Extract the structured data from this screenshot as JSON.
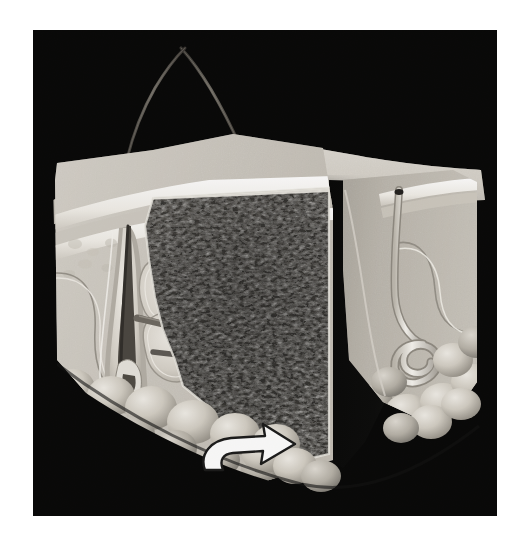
{
  "figure": {
    "domain": "anatomical-illustration",
    "subject": "Cross-section of human skin (three-dimensional block diagram)",
    "rendering": "grayscale airbrush / halftone medical illustration",
    "background_color": "#000000",
    "page_color": "#ffffff",
    "frame": {
      "x": 33,
      "y": 30,
      "width": 464,
      "height": 486
    },
    "palette": {
      "background_black": "#000000",
      "void_shadow": "#050505",
      "tissue_light": "#e3e0d9",
      "tissue_highlight": "#f4f2ec",
      "tissue_midtone": "#b9b4aa",
      "tissue_shadow": "#7d786f",
      "dermis_dark": "#2a2824",
      "dermis_fiber": "#6e6a61",
      "hair_shaft": "#4a4640",
      "arrow_fill": "#ffffff",
      "arrow_outline": "#1a1a1a",
      "fat_lobule": "#cfcac0",
      "fat_lobule_shadow": "#8d887e",
      "epidermis_band": "#f6f4ef",
      "gland_duct": "#f2efe8"
    },
    "structures": [
      {
        "id": "hair-shaft-left",
        "label": "Hair shaft (emergent, left)",
        "type": "hair-shaft",
        "description": "Long thin dark shaft curving up and to the right from the skin surface"
      },
      {
        "id": "hair-shaft-right",
        "label": "Hair shaft (emergent, right)",
        "type": "hair-shaft",
        "description": "Second shaft emerging from a follicular pore on the surface crest"
      },
      {
        "id": "skin-surface",
        "label": "Skin surface (epidermal surface)",
        "type": "surface",
        "description": "Pale undulating top plane of the tissue block"
      },
      {
        "id": "epidermis",
        "label": "Epidermis",
        "type": "layer",
        "description": "Bright narrow band along the upper cut face"
      },
      {
        "id": "dermis",
        "label": "Dermis",
        "type": "layer",
        "description": "Pale tissue body beneath the epidermis holding appendages"
      },
      {
        "id": "collagen-network",
        "label": "Dermal collagen / elastic fibre network",
        "type": "texture-panel",
        "description": "Dark densely-speckled rectangular cut panel in the centre, indicated by the arrow"
      },
      {
        "id": "hair-follicle",
        "label": "Hair follicle with bulb",
        "type": "appendage",
        "description": "U-shaped invagination descending into the dermis on the left face"
      },
      {
        "id": "sebaceous-gland",
        "label": "Sebaceous gland lobules",
        "type": "appendage",
        "description": "Cloverleaf-shaped pale lobules attached to the follicle"
      },
      {
        "id": "arrector-pili",
        "label": "Arrector pili muscle",
        "type": "appendage",
        "description": "Dark oblique band running from the follicle toward the epidermis"
      },
      {
        "id": "eccrine-sweat-gland",
        "label": "Eccrine sweat gland with coiled secretory portion",
        "type": "appendage",
        "description": "Bright tubular duct on the right descending to a tight coil"
      },
      {
        "id": "sweat-pore",
        "label": "Sweat pore",
        "type": "opening",
        "description": "Small dark opening where the duct meets the surface on the right"
      },
      {
        "id": "subcutaneous-fat",
        "label": "Subcutaneous fat lobules (hypodermis)",
        "type": "layer",
        "description": "Row of rounded adipocyte globules along the lower border"
      },
      {
        "id": "cut-void",
        "label": "Cut-away void",
        "type": "void",
        "description": "Deep black wedge separating the left and right tissue blocks"
      },
      {
        "id": "indicator-arrow",
        "label": "Indicator arrow",
        "type": "annotation",
        "description": "White curved arrow in the lower centre pointing right into the dark collagen panel",
        "points_to": "collagen-network",
        "direction": "right"
      }
    ],
    "annotations": {
      "arrow_count": 1,
      "text_labels": [],
      "leader_lines": 0
    }
  }
}
